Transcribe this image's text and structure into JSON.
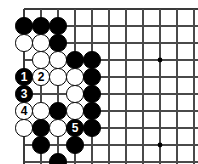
{
  "figure": {
    "kind": "go-problem-diagram",
    "width": 198,
    "height": 164,
    "background_color": "#ffffff",
    "line_color": "#4a4a4a",
    "edge_line_color": "#3a3a3a",
    "black_color": "#000000",
    "white_color": "#ffffff",
    "black_label_color": "#ffffff",
    "white_label_color": "#000000"
  },
  "grid": {
    "origin_x": 24,
    "origin_y": 9,
    "spacing": 17,
    "columns": 10,
    "rows": 9,
    "show_top_edge": true,
    "show_left_edge": true,
    "star_points": [
      {
        "col": 8,
        "row": 3
      },
      {
        "col": 3,
        "row": 8
      },
      {
        "col": 8,
        "row": 8
      }
    ]
  },
  "stones": [
    {
      "col": 0,
      "row": 1,
      "color": "black",
      "label": ""
    },
    {
      "col": 1,
      "row": 1,
      "color": "black",
      "label": ""
    },
    {
      "col": 2,
      "row": 1,
      "color": "black",
      "label": ""
    },
    {
      "col": 0,
      "row": 2,
      "color": "white",
      "label": ""
    },
    {
      "col": 1,
      "row": 2,
      "color": "white",
      "label": ""
    },
    {
      "col": 2,
      "row": 2,
      "color": "black",
      "label": ""
    },
    {
      "col": 1,
      "row": 3,
      "color": "white",
      "label": ""
    },
    {
      "col": 2,
      "row": 3,
      "color": "white",
      "label": ""
    },
    {
      "col": 3,
      "row": 3,
      "color": "black",
      "label": ""
    },
    {
      "col": 4,
      "row": 3,
      "color": "black",
      "label": ""
    },
    {
      "col": 0,
      "row": 4,
      "color": "black",
      "label": "1"
    },
    {
      "col": 1,
      "row": 4,
      "color": "white",
      "label": "2"
    },
    {
      "col": 2,
      "row": 4,
      "color": "white",
      "label": ""
    },
    {
      "col": 3,
      "row": 4,
      "color": "white",
      "label": ""
    },
    {
      "col": 4,
      "row": 4,
      "color": "black",
      "label": ""
    },
    {
      "col": 0,
      "row": 5,
      "color": "black",
      "label": "3"
    },
    {
      "col": 3,
      "row": 5,
      "color": "white",
      "label": ""
    },
    {
      "col": 4,
      "row": 5,
      "color": "black",
      "label": ""
    },
    {
      "col": 0,
      "row": 6,
      "color": "white",
      "label": "4"
    },
    {
      "col": 1,
      "row": 6,
      "color": "white",
      "label": ""
    },
    {
      "col": 2,
      "row": 6,
      "color": "black",
      "label": ""
    },
    {
      "col": 3,
      "row": 6,
      "color": "white",
      "label": ""
    },
    {
      "col": 4,
      "row": 6,
      "color": "black",
      "label": ""
    },
    {
      "col": 0,
      "row": 7,
      "color": "white",
      "label": ""
    },
    {
      "col": 1,
      "row": 7,
      "color": "black",
      "label": ""
    },
    {
      "col": 2,
      "row": 7,
      "color": "white",
      "label": ""
    },
    {
      "col": 3,
      "row": 7,
      "color": "black",
      "label": "5"
    },
    {
      "col": 4,
      "row": 7,
      "color": "black",
      "label": ""
    },
    {
      "col": 1,
      "row": 8,
      "color": "black",
      "label": ""
    },
    {
      "col": 3,
      "row": 8,
      "color": "black",
      "label": ""
    },
    {
      "col": 2,
      "row": 9,
      "color": "black",
      "label": ""
    }
  ],
  "move_sequence": [
    {
      "number": "1",
      "color": "black"
    },
    {
      "number": "2",
      "color": "white"
    },
    {
      "number": "3",
      "color": "black"
    },
    {
      "number": "4",
      "color": "white"
    },
    {
      "number": "5",
      "color": "black"
    }
  ]
}
